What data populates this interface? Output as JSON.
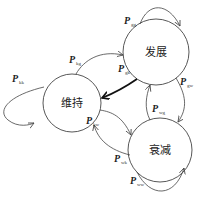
{
  "diagram": {
    "type": "state-transition",
    "nodes": [
      {
        "id": "k",
        "label": "维持",
        "cx": 72,
        "cy": 103,
        "r": 29
      },
      {
        "id": "g",
        "label": "发展",
        "cx": 156,
        "cy": 52,
        "r": 33
      },
      {
        "id": "w",
        "label": "衰减",
        "cx": 160,
        "cy": 150,
        "r": 32
      }
    ],
    "edges": [
      {
        "from": "k",
        "to": "k",
        "label": "P",
        "sub": "kk"
      },
      {
        "from": "k",
        "to": "g",
        "label": "P",
        "sub": "kg"
      },
      {
        "from": "g",
        "to": "g",
        "label": "P",
        "sub": "gg"
      },
      {
        "from": "g",
        "to": "k",
        "label": "P",
        "sub": "gk",
        "bold": true
      },
      {
        "from": "g",
        "to": "w",
        "label": "P",
        "sub": "gw"
      },
      {
        "from": "w",
        "to": "g",
        "label": "P",
        "sub": "wg"
      },
      {
        "from": "k",
        "to": "w",
        "label": "P",
        "sub": "kw"
      },
      {
        "from": "w",
        "to": "k",
        "label": "P",
        "sub": "wk"
      },
      {
        "from": "w",
        "to": "w",
        "label": "P",
        "sub": "ww"
      }
    ]
  },
  "labels": {
    "node_k": "维持",
    "node_g": "发展",
    "node_w": "衰减",
    "p": "P",
    "kk": "kk",
    "kg": "kg",
    "gg": "gg",
    "gk": "gk",
    "gw": "gw",
    "wg": "wg",
    "kw": "kw",
    "wk": "wk",
    "ww": "ww"
  },
  "colors": {
    "stroke": "#444444",
    "bold_stroke": "#111111",
    "background": "#ffffff"
  }
}
